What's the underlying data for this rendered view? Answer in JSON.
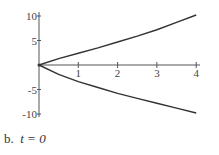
{
  "chart_data": {
    "type": "line",
    "title": "",
    "caption": "b.  t = 0",
    "caption_label": "b.",
    "caption_math": "t = 0",
    "xlabel": "",
    "ylabel": "",
    "xlim": [
      0,
      4
    ],
    "ylim": [
      -10,
      10
    ],
    "x_ticks": [
      1,
      2,
      3,
      4
    ],
    "x_tick_labels": [
      "1",
      "2",
      "3",
      "4"
    ],
    "y_ticks": [
      10,
      5,
      -5,
      -10
    ],
    "y_tick_labels": [
      "10",
      "5",
      "-5",
      "-10"
    ],
    "grid": false,
    "legend": null,
    "series": [
      {
        "name": "upper",
        "x": [
          0,
          0.5,
          1,
          1.5,
          2,
          2.5,
          3,
          3.5,
          4
        ],
        "y": [
          0,
          1.3,
          2.4,
          3.5,
          4.7,
          5.9,
          7.2,
          8.7,
          10.2
        ]
      },
      {
        "name": "lower",
        "x": [
          0,
          0.5,
          1,
          1.5,
          2,
          2.5,
          3,
          3.5,
          4
        ],
        "y": [
          0,
          -1.9,
          -3.4,
          -4.6,
          -5.8,
          -6.8,
          -7.8,
          -8.8,
          -9.8
        ]
      }
    ],
    "colors": {
      "line": "#333333",
      "axis": "#555555"
    }
  }
}
